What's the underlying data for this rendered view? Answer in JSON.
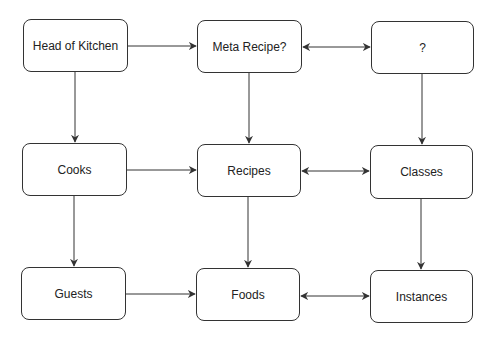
{
  "diagram": {
    "nodes": [
      {
        "id": "head_of_kitchen",
        "label": "Head of Kitchen",
        "x": 23,
        "y": 19,
        "w": 105,
        "h": 53
      },
      {
        "id": "meta_recipe",
        "label": "Meta Recipe?",
        "x": 197,
        "y": 20,
        "w": 105,
        "h": 53
      },
      {
        "id": "unknown",
        "label": "?",
        "x": 371,
        "y": 21,
        "w": 103,
        "h": 53
      },
      {
        "id": "cooks",
        "label": "Cooks",
        "x": 22,
        "y": 143,
        "w": 105,
        "h": 53
      },
      {
        "id": "recipes",
        "label": "Recipes",
        "x": 197,
        "y": 144,
        "w": 104,
        "h": 53
      },
      {
        "id": "classes",
        "label": "Classes",
        "x": 370,
        "y": 145,
        "w": 103,
        "h": 54
      },
      {
        "id": "guests",
        "label": "Guests",
        "x": 21,
        "y": 267,
        "w": 105,
        "h": 53
      },
      {
        "id": "foods",
        "label": "Foods",
        "x": 196,
        "y": 268,
        "w": 104,
        "h": 53
      },
      {
        "id": "instances",
        "label": "Instances",
        "x": 370,
        "y": 270,
        "w": 103,
        "h": 53
      }
    ],
    "edges": [
      {
        "from": "head_of_kitchen",
        "to": "meta_recipe",
        "type": "directed"
      },
      {
        "from": "meta_recipe",
        "to": "unknown",
        "type": "bidirectional"
      },
      {
        "from": "head_of_kitchen",
        "to": "cooks",
        "type": "directed"
      },
      {
        "from": "meta_recipe",
        "to": "recipes",
        "type": "directed"
      },
      {
        "from": "unknown",
        "to": "classes",
        "type": "directed"
      },
      {
        "from": "cooks",
        "to": "recipes",
        "type": "directed"
      },
      {
        "from": "recipes",
        "to": "classes",
        "type": "bidirectional"
      },
      {
        "from": "cooks",
        "to": "guests",
        "type": "directed"
      },
      {
        "from": "recipes",
        "to": "foods",
        "type": "directed"
      },
      {
        "from": "classes",
        "to": "instances",
        "type": "directed"
      },
      {
        "from": "guests",
        "to": "foods",
        "type": "directed"
      },
      {
        "from": "foods",
        "to": "instances",
        "type": "bidirectional"
      }
    ],
    "colors": {
      "stroke": "#333333",
      "text": "#222222",
      "background": "#ffffff"
    }
  }
}
